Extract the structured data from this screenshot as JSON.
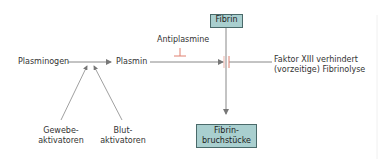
{
  "diagram": {
    "nodes": {
      "plasminogen": "Plasminogen",
      "plasmin": "Plasmin",
      "antiplasmine": "Antiplasmine",
      "fibrin": "Fibrin",
      "gewebe_line1": "Gewebe-",
      "gewebe_line2": "aktivatoren",
      "blut_line1": "Blut-",
      "blut_line2": "aktivatoren",
      "faktor_line1": "Faktor XIII verhindert",
      "faktor_line2": "(vorzeitige) Fibrinolyse",
      "fragments_line1": "Fibrin-",
      "fragments_line2": "bruchstücke"
    },
    "colors": {
      "box_fill": "#a9cfcf",
      "box_border": "#4a6a6a",
      "inhibitor": "#e08070",
      "line": "#888888"
    }
  }
}
